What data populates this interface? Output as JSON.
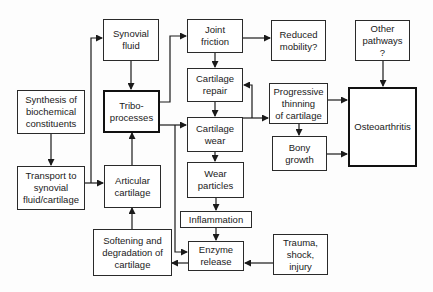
{
  "diagram": {
    "nodes": {
      "synovial_fluid": "Synovial\nfluid",
      "tribo_processes": "Tribo-\nprocesses",
      "synthesis": "Synthesis of\nbiochemical\nconstituents",
      "transport": "Transport to\nsynovial\nfluid/cartilage",
      "articular_cartilage": "Articular\ncartilage",
      "softening": "Softening and\ndegradation of\ncartilage",
      "joint_friction": "Joint\nfriction",
      "reduced_mobility": "Reduced\nmobility?",
      "other_pathways": "Other\npathways\n?",
      "cartilage_repair": "Cartilage\nrepair",
      "cartilage_wear": "Cartilage\nwear",
      "progressive_thinning": "Progressive\nthinning\nof cartilage",
      "bony_growth": "Bony\ngrowth",
      "osteoarthritis": "Osteoarthritis",
      "wear_particles": "Wear\nparticles",
      "inflammation": "Inflammation",
      "enzyme_release": "Enzyme\nrelease",
      "trauma": "Trauma,\nshock,\ninjury"
    },
    "edges": [
      [
        "synthesis",
        "transport"
      ],
      [
        "transport",
        "synovial_fluid"
      ],
      [
        "transport",
        "articular_cartilage"
      ],
      [
        "synovial_fluid",
        "tribo_processes"
      ],
      [
        "articular_cartilage",
        "tribo_processes"
      ],
      [
        "softening",
        "articular_cartilage"
      ],
      [
        "tribo_processes",
        "joint_friction"
      ],
      [
        "tribo_processes",
        "cartilage_wear"
      ],
      [
        "tribo_processes",
        "enzyme_release"
      ],
      [
        "joint_friction",
        "reduced_mobility"
      ],
      [
        "joint_friction",
        "cartilage_repair"
      ],
      [
        "cartilage_repair",
        "cartilage_wear"
      ],
      [
        "cartilage_wear",
        "cartilage_repair"
      ],
      [
        "cartilage_wear",
        "progressive_thinning"
      ],
      [
        "cartilage_wear",
        "wear_particles"
      ],
      [
        "progressive_thinning",
        "osteoarthritis"
      ],
      [
        "progressive_thinning",
        "bony_growth"
      ],
      [
        "bony_growth",
        "osteoarthritis"
      ],
      [
        "other_pathways",
        "osteoarthritis"
      ],
      [
        "wear_particles",
        "inflammation"
      ],
      [
        "inflammation",
        "enzyme_release"
      ],
      [
        "trauma",
        "enzyme_release"
      ],
      [
        "enzyme_release",
        "softening"
      ]
    ]
  }
}
